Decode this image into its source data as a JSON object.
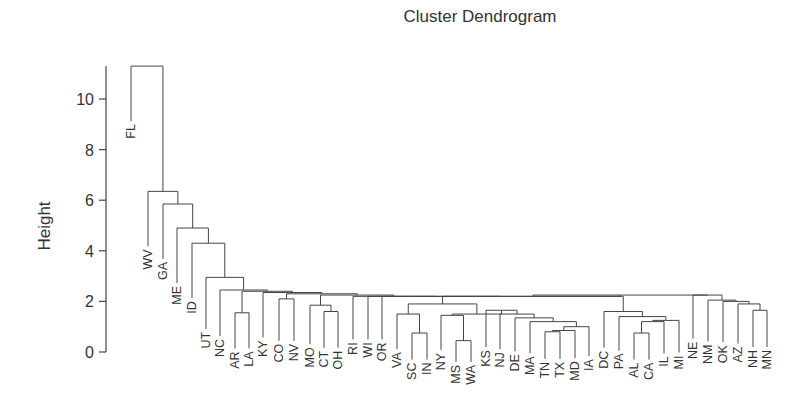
{
  "chart_data": {
    "type": "dendrogram",
    "title": "Cluster Dendrogram",
    "xlabel": "",
    "ylabel": "Height",
    "yticks": [
      0,
      2,
      4,
      6,
      8,
      10
    ],
    "ylim": [
      0,
      11.5
    ],
    "leaves": [
      "FL",
      "WV",
      "GA",
      "ME",
      "ID",
      "UT",
      "NC",
      "AR",
      "LA",
      "KY",
      "CO",
      "NV",
      "MO",
      "CT",
      "OH",
      "RI",
      "WI",
      "OR",
      "VA",
      "SC",
      "IN",
      "NY",
      "MS",
      "WA",
      "KS",
      "NJ",
      "DE",
      "MA",
      "TN",
      "TX",
      "MD",
      "IA",
      "DC",
      "PA",
      "AL",
      "CA",
      "IL",
      "MI",
      "NE",
      "NM",
      "OK",
      "AZ",
      "NH",
      "MN"
    ],
    "tree": {
      "h": 11.3,
      "c": [
        "FL",
        {
          "h": 6.35,
          "c": [
            "WV",
            {
              "h": 5.85,
              "c": [
                "GA",
                {
                  "h": 4.9,
                  "c": [
                    "ME",
                    {
                      "h": 4.3,
                      "c": [
                        "ID",
                        {
                          "h": 2.95,
                          "c": [
                            "UT",
                            {
                              "h": 2.45,
                              "c": [
                                "NC",
                                {
                                  "h": 2.4,
                                  "c": [
                                    {
                                      "h": 1.55,
                                      "c": [
                                        "AR",
                                        "LA"
                                      ]
                                    },
                                    {
                                      "h": 2.35,
                                      "c": [
                                        "KY",
                                        {
                                          "h": 2.3,
                                          "c": [
                                            {
                                              "h": 2.1,
                                              "c": [
                                                "CO",
                                                "NV"
                                              ]
                                            },
                                            {
                                              "h": 2.25,
                                              "c": [
                                                {
                                                  "h": 1.85,
                                                  "c": [
                                                    "MO",
                                                    {
                                                      "h": 1.6,
                                                      "c": [
                                                        "CT",
                                                        "OH"
                                                      ]
                                                    }
                                                  ]
                                                },
                                                {
                                                  "h": 2.2,
                                                  "c": [
                                                    "RI",
                                                    {
                                                      "h": 2.2,
                                                      "c": [
                                                        "WI",
                                                        {
                                                          "h": 2.2,
                                                          "c": [
                                                            "OR",
                                                            {
                                                              "h": 2.25,
                                                              "c": [
                                                                {
                                                                  "h": 2.2,
                                                                  "c": [
                                                                    {
                                                                      "h": 1.9,
                                                                      "c": [
                                                                        {
                                                                          "h": 1.5,
                                                                          "c": [
                                                                            "VA",
                                                                            {
                                                                              "h": 0.75,
                                                                              "c": [
                                                                                "SC",
                                                                                "IN"
                                                                              ]
                                                                            }
                                                                          ]
                                                                        },
                                                                        {
                                                                          "h": 1.5,
                                                                          "c": [
                                                                            {
                                                                              "h": 1.45,
                                                                              "c": [
                                                                                "NY",
                                                                                {
                                                                                  "h": 0.45,
                                                                                  "c": [
                                                                                    "MS",
                                                                                    "WA"
                                                                                  ]
                                                                                }
                                                                              ]
                                                                            },
                                                                            {
                                                                              "h": 1.65,
                                                                              "c": [
                                                                                "KS",
                                                                                {
                                                                                  "h": 1.5,
                                                                                  "c": [
                                                                                    "NJ",
                                                                                    {
                                                                                      "h": 1.35,
                                                                                      "c": [
                                                                                        "DE",
                                                                                        {
                                                                                          "h": 1.2,
                                                                                          "c": [
                                                                                            "MA",
                                                                                            {
                                                                                              "h": 1.0,
                                                                                              "c": [
                                                                                                {
                                                                                                  "h": 0.85,
                                                                                                  "c": [
                                                                                                    {
                                                                                                      "h": 0.8,
                                                                                                      "c": [
                                                                                                        "TN",
                                                                                                        "TX"
                                                                                                      ]
                                                                                                    },
                                                                                                    "MD"
                                                                                                  ]
                                                                                                },
                                                                                                "IA"
                                                                                              ]
                                                                                            }
                                                                                          ]
                                                                                        }
                                                                                      ]
                                                                                    }
                                                                                  ]
                                                                                }
                                                                              ]
                                                                            }
                                                                          ]
                                                                        }
                                                                      ]
                                                                    },
                                                                    {
                                                                      "h": 1.6,
                                                                      "c": [
                                                                        "DC",
                                                                        {
                                                                          "h": 1.4,
                                                                          "c": [
                                                                            "PA",
                                                                            {
                                                                              "h": 1.25,
                                                                              "c": [
                                                                                {
                                                                                  "h": 1.2,
                                                                                  "c": [
                                                                                    {
                                                                                      "h": 0.75,
                                                                                      "c": [
                                                                                        "AL",
                                                                                        "CA"
                                                                                      ]
                                                                                    },
                                                                                    "IL"
                                                                                  ]
                                                                                },
                                                                                "MI"
                                                                              ]
                                                                            }
                                                                          ]
                                                                        }
                                                                      ]
                                                                    }
                                                                  ]
                                                                },
                                                                {
                                                                  "h": 2.25,
                                                                  "c": [
                                                                    "NE",
                                                                    {
                                                                      "h": 2.05,
                                                                      "c": [
                                                                        "NM",
                                                                        {
                                                                          "h": 2.0,
                                                                          "c": [
                                                                            "OK",
                                                                            {
                                                                              "h": 1.9,
                                                                              "c": [
                                                                                "AZ",
                                                                                {
                                                                                  "h": 1.65,
                                                                                  "c": [
                                                                                    "NH",
                                                                                    "MN"
                                                                                  ]
                                                                                }
                                                                              ]
                                                                            }
                                                                          ]
                                                                        }
                                                                      ]
                                                                    }
                                                                  ]
                                                                }
                                                              ]
                                                            }
                                                          ]
                                                        }
                                                      ]
                                                    }
                                                  ]
                                                }
                                              ]
                                            }
                                          ]
                                        }
                                      ]
                                    }
                                  ]
                                }
                              ]
                            }
                          ]
                        }
                      ]
                    }
                  ]
                }
              ]
            }
          ]
        }
      ]
    },
    "leaf_x_overrides": {
      "FL": 131,
      "WV": 148,
      "GA": 163,
      "ME": 177,
      "ID": 192,
      "UT": 206,
      "NC": 220,
      "AR": 235,
      "LA": 249,
      "KY": 263,
      "CO": 279,
      "NV": 294,
      "MO": 310,
      "CT": 324,
      "OH": 338,
      "RI": 353,
      "WI": 368,
      "OR": 382,
      "VA": 397,
      "SC": 412,
      "IN": 427,
      "NY": 441,
      "MS": 456,
      "WA": 471,
      "KS": 486,
      "NJ": 500,
      "DE": 515,
      "MA": 530,
      "TN": 545,
      "TX": 560,
      "MD": 575,
      "IA": 589,
      "DC": 604,
      "PA": 619,
      "AL": 634,
      "CA": 649,
      "IL": 664,
      "MI": 679,
      "NE": 693,
      "NM": 708,
      "OK": 723,
      "AZ": 738,
      "NH": 753,
      "MN": 767
    },
    "grid": false,
    "legend": null
  }
}
